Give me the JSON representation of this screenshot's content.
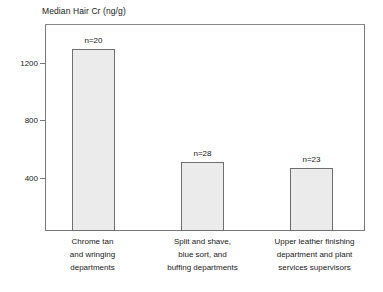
{
  "chart_data": {
    "type": "bar",
    "title": "Median Hair Cr (ng/g)",
    "xlabel": "",
    "ylabel": "Median Hair Cr (ng/g)",
    "ylim": [
      0,
      1400
    ],
    "yticks": [
      400,
      800,
      1200
    ],
    "ytick_labels": [
      "400",
      "800",
      "1200"
    ],
    "grid": false,
    "legend": "none",
    "categories": [
      "Chrome tan and wringing departments",
      "Split and shave, blue sort, and buffing departments",
      "Upper leather finishing department and plant services supervisors"
    ],
    "category_lines": [
      [
        "Chrome tan",
        "and wringing",
        "departments"
      ],
      [
        "Split and shave,",
        "blue sort, and",
        "buffing departments"
      ],
      [
        "Upper leather finishing",
        "department and plant",
        "services supervisors"
      ]
    ],
    "values": [
      1295,
      510,
      470
    ],
    "annotations": [
      "n=20",
      "n=28",
      "n=23"
    ],
    "counts": [
      20,
      28,
      23
    ],
    "bar_fill_color": "#ebebeb",
    "bar_border_color": "#6e6e6e",
    "axis_color": "#7a7a7a",
    "text_color": "#1a1a1a"
  },
  "chart": {
    "title": "Median Hair Cr (ng/g)",
    "y_ticks": [
      {
        "label": "1200",
        "value": 1200
      },
      {
        "label": "800",
        "value": 800
      },
      {
        "label": "400",
        "value": 400
      }
    ],
    "bars": [
      {
        "value": 1295,
        "n_label": "n=20",
        "line1": "Chrome tan",
        "line2": "and wringing",
        "line3": "departments"
      },
      {
        "value": 510,
        "n_label": "n=28",
        "line1": "Split and shave,",
        "line2": "blue sort, and",
        "line3": "buffing departments"
      },
      {
        "value": 470,
        "n_label": "n=23",
        "line1": "Upper leather finishing",
        "line2": "department and plant",
        "line3": "services supervisors"
      }
    ]
  }
}
